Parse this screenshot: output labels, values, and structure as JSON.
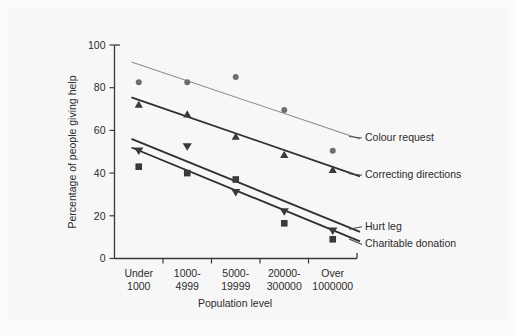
{
  "chart_data": {
    "type": "scatter",
    "title": "",
    "subtitle": "",
    "xlabel": "Population level",
    "ylabel": "Percentage of people giving help",
    "categories": [
      "Under\n1000",
      "1000-\n4999",
      "5000-\n19999",
      "20000-\n300000",
      "Over\n1000000"
    ],
    "category_lines": [
      [
        "Under",
        "1000"
      ],
      [
        "1000-",
        "4999"
      ],
      [
        "5000-",
        "19999"
      ],
      [
        "20000-",
        "300000"
      ],
      [
        "Over",
        "1000000"
      ]
    ],
    "ylim": [
      0,
      100
    ],
    "yticks": [
      0,
      20,
      40,
      60,
      80,
      100
    ],
    "ytick_labels": [
      "0",
      "20",
      "40",
      "60",
      "80",
      "100"
    ],
    "grid": false,
    "legend_position": "right-inline-annotations",
    "series": [
      {
        "name": "Colour request",
        "marker": "circle",
        "color": "#6e6e6e",
        "values": [
          82.5,
          82.5,
          85,
          69.5,
          50.5
        ],
        "trend_start": 92,
        "trend_end": 56,
        "line_color": "#8a8a8a",
        "line_width": 1.1
      },
      {
        "name": "Correcting directions",
        "marker": "triangle-up",
        "color": "#3a3a3a",
        "values": [
          72,
          67.5,
          57,
          48.5,
          41.5
        ],
        "trend_start": 75.5,
        "trend_end": 38.5,
        "line_color": "#2f2f2f",
        "line_width": 1.8
      },
      {
        "name": "Hurt leg",
        "marker": "triangle-down",
        "color": "#3a3a3a",
        "values": [
          50.5,
          52.5,
          31,
          22,
          13
        ],
        "trend_start": 56,
        "trend_end": 12.5,
        "line_color": "#2f2f2f",
        "line_width": 1.8
      },
      {
        "name": "Charitable donation",
        "marker": "square",
        "color": "#3a3a3a",
        "values": [
          43,
          40,
          37,
          16.5,
          9
        ],
        "trend_start": 52,
        "trend_end": 8,
        "line_color": "#2f2f2f",
        "line_width": 1.8
      }
    ]
  },
  "annotations": [
    {
      "label": "Colour request"
    },
    {
      "label": "Correcting directions"
    },
    {
      "label": "Hurt leg"
    },
    {
      "label": "Charitable donation"
    }
  ],
  "colors": {
    "background": "#fbfbfb",
    "plate": "#f7f7f7",
    "axis": "#3a3a3a",
    "text": "#2b2b2b",
    "marker_dark": "#3a3a3a",
    "marker_grey": "#6e6e6e"
  }
}
